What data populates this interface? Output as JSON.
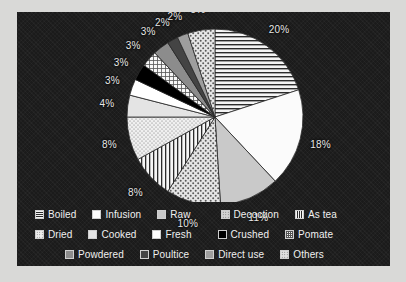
{
  "chart_data": {
    "type": "pie",
    "title": "",
    "subtitle": "",
    "xlabel": "",
    "ylabel": "",
    "legend_position": "bottom",
    "grid": false,
    "unit": "%",
    "categories": [
      "Boiled",
      "Infusion",
      "Raw",
      "Decoction",
      "As tea",
      "Dried",
      "Cooked",
      "Fresh",
      "Crushed",
      "Pomate",
      "Powdered",
      "Poultice",
      "Direct use",
      "Others"
    ],
    "values": [
      20,
      18,
      11,
      10,
      8,
      8,
      4,
      3,
      3,
      3,
      3,
      2,
      2,
      5
    ],
    "slices": [
      {
        "label": "Boiled",
        "value": 20,
        "display": "20%",
        "fill": "#f2f2f2",
        "pattern": "horizontal-lines"
      },
      {
        "label": "Infusion",
        "value": 18,
        "display": "18%",
        "fill": "#fbfbfb",
        "pattern": "solid"
      },
      {
        "label": "Raw",
        "value": 11,
        "display": "11%",
        "fill": "#c9c9c9",
        "pattern": "solid"
      },
      {
        "label": "Decoction",
        "value": 10,
        "display": "10%",
        "fill": "#d5d5d5",
        "pattern": "stipple-coarse"
      },
      {
        "label": "As tea",
        "value": 8,
        "display": "8%",
        "fill": "#f4f4f4",
        "pattern": "vertical-lines"
      },
      {
        "label": "Dried",
        "value": 8,
        "display": "8%",
        "fill": "#ededed",
        "pattern": "stipple-fine"
      },
      {
        "label": "Cooked",
        "value": 4,
        "display": "4%",
        "fill": "#e4e4e4",
        "pattern": "solid"
      },
      {
        "label": "Fresh",
        "value": 3,
        "display": "3%",
        "fill": "#ffffff",
        "pattern": "solid"
      },
      {
        "label": "Crushed",
        "value": 3,
        "display": "3%",
        "fill": "#000000",
        "pattern": "solid"
      },
      {
        "label": "Pomate",
        "value": 3,
        "display": "3%",
        "fill": "#f7f7f7",
        "pattern": "grid-fine"
      },
      {
        "label": "Powdered",
        "value": 3,
        "display": "3%",
        "fill": "#8c8c8c",
        "pattern": "solid"
      },
      {
        "label": "Poultice",
        "value": 2,
        "display": "2%",
        "fill": "#444444",
        "pattern": "solid"
      },
      {
        "label": "Direct use",
        "value": 2,
        "display": "2%",
        "fill": "#9e9e9e",
        "pattern": "solid"
      },
      {
        "label": "Others",
        "value": 5,
        "display": "5%",
        "fill": "#e0e0e0",
        "pattern": "stipple-coarse"
      }
    ]
  },
  "legend": {
    "rows": [
      [
        {
          "label": "Boiled",
          "swatch": "#f2f2f2",
          "pattern": "horizontal-lines"
        },
        {
          "label": "Infusion",
          "swatch": "#fbfbfb",
          "pattern": "solid"
        },
        {
          "label": "Raw",
          "swatch": "#c9c9c9",
          "pattern": "solid"
        },
        {
          "label": "Decoction",
          "swatch": "#d5d5d5",
          "pattern": "stipple-coarse"
        },
        {
          "label": "As tea",
          "swatch": "#f4f4f4",
          "pattern": "vertical-lines"
        }
      ],
      [
        {
          "label": "Dried",
          "swatch": "#ededed",
          "pattern": "stipple-fine"
        },
        {
          "label": "Cooked",
          "swatch": "#e4e4e4",
          "pattern": "solid"
        },
        {
          "label": "Fresh",
          "swatch": "#ffffff",
          "pattern": "solid"
        },
        {
          "label": "Crushed",
          "swatch": "#000000",
          "pattern": "solid"
        },
        {
          "label": "Pomate",
          "swatch": "#f7f7f7",
          "pattern": "grid-fine"
        }
      ],
      [
        {
          "label": "Powdered",
          "swatch": "#8c8c8c",
          "pattern": "solid"
        },
        {
          "label": "Poultice",
          "swatch": "#444444",
          "pattern": "solid"
        },
        {
          "label": "Direct use",
          "swatch": "#9e9e9e",
          "pattern": "solid"
        },
        {
          "label": "Others",
          "swatch": "#e0e0e0",
          "pattern": "stipple-coarse"
        }
      ]
    ]
  },
  "colors": {
    "panel_background": "#1b1b1b",
    "page_background": "#d9d9d7",
    "label_text": "#e8e8e8",
    "legend_text": "#f0f0f0",
    "slice_outline": "#2a2a2a"
  }
}
